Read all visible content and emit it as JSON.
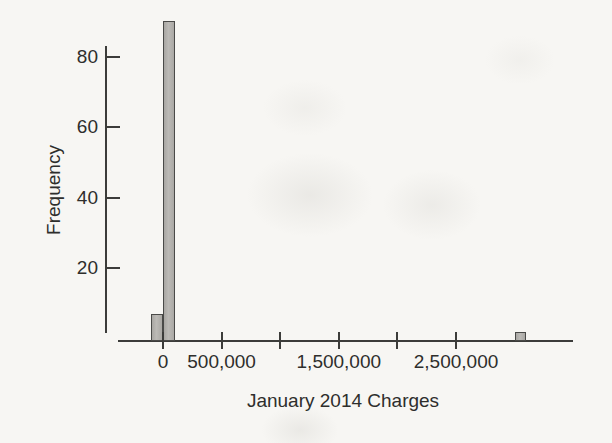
{
  "chart_data": {
    "type": "bar",
    "subtype": "histogram",
    "title": "",
    "xlabel": "January 2014 Charges",
    "ylabel": "Frequency",
    "bins": [
      {
        "start": -100000,
        "end": 0,
        "frequency": 7
      },
      {
        "start": 0,
        "end": 100000,
        "frequency": 90
      },
      {
        "start": 3000000,
        "end": 3100000,
        "frequency": 2
      }
    ],
    "x_ticks": [
      {
        "value": 0,
        "label": "0"
      },
      {
        "value": 500000,
        "label": "500,000"
      },
      {
        "value": 1000000,
        "label": ""
      },
      {
        "value": 1500000,
        "label": "1,500,000"
      },
      {
        "value": 2000000,
        "label": ""
      },
      {
        "value": 2500000,
        "label": "2,500,000"
      }
    ],
    "y_ticks": [
      {
        "value": 20,
        "label": "20"
      },
      {
        "value": 40,
        "label": "40"
      },
      {
        "value": 60,
        "label": "60"
      },
      {
        "value": 80,
        "label": "80"
      }
    ],
    "xlim": [
      -470000,
      3520000
    ],
    "ylim": [
      0,
      93
    ],
    "grid": false,
    "legend": null,
    "colors": {
      "bar_fill": "#b2b0ac",
      "bar_border": "#4a4a48",
      "axis": "#3c3c3a",
      "text": "#2e2e2c",
      "background": "#f7f6f3"
    }
  }
}
